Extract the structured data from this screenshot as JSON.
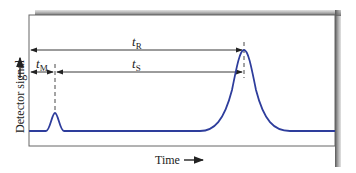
{
  "diagram": {
    "type": "chromatogram",
    "x_axis_label": "Time",
    "y_axis_label": "Detector signal",
    "annotations": {
      "t_R": {
        "main": "t",
        "sub": "R"
      },
      "t_S": {
        "main": "t",
        "sub": "S"
      },
      "t_M": {
        "main": "t",
        "sub": "M"
      }
    },
    "colors": {
      "trace": "#2e3d9c",
      "frame": "#555555",
      "shadow": "#8a8a8a",
      "arrows": "#222222"
    }
  }
}
